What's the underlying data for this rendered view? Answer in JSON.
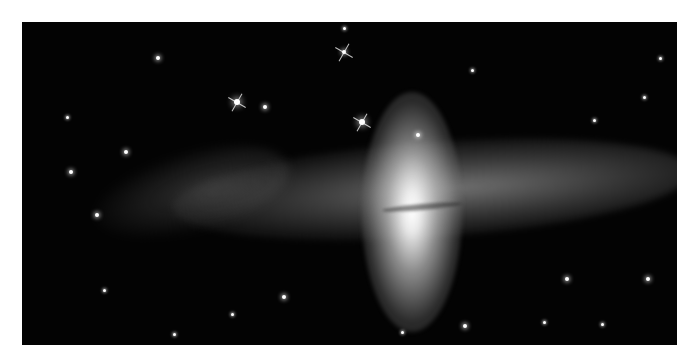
{
  "image": {
    "subject": "polar-ring galaxy",
    "description": "Astronomical photograph of a galaxy with a bright vertical elliptical bulge crossed by a horizontal ring of stars and dust, on a black starfield background with a white border",
    "colors": {
      "background": "#ffffff",
      "sky": "#030303",
      "core": "#ffffff"
    }
  },
  "stars": [
    {
      "x": 215,
      "y": 80,
      "r": 3,
      "spikes": true
    },
    {
      "x": 340,
      "y": 100,
      "r": 3,
      "spikes": true
    },
    {
      "x": 322,
      "y": 30,
      "r": 2,
      "spikes": true
    },
    {
      "x": 136,
      "y": 36,
      "r": 2
    },
    {
      "x": 243,
      "y": 85,
      "r": 2
    },
    {
      "x": 104,
      "y": 130,
      "r": 2
    },
    {
      "x": 49,
      "y": 150,
      "r": 2
    },
    {
      "x": 75,
      "y": 193,
      "r": 2
    },
    {
      "x": 396,
      "y": 113,
      "r": 2
    },
    {
      "x": 545,
      "y": 257,
      "r": 2
    },
    {
      "x": 626,
      "y": 257,
      "r": 2
    },
    {
      "x": 262,
      "y": 275,
      "r": 2
    },
    {
      "x": 443,
      "y": 304,
      "r": 2
    },
    {
      "x": 638,
      "y": 36,
      "r": 1.5
    },
    {
      "x": 322,
      "y": 6,
      "r": 1.5
    },
    {
      "x": 45,
      "y": 95,
      "r": 1.5
    },
    {
      "x": 622,
      "y": 75,
      "r": 1.5
    },
    {
      "x": 572,
      "y": 98,
      "r": 1.5
    },
    {
      "x": 522,
      "y": 300,
      "r": 1.5
    },
    {
      "x": 580,
      "y": 302,
      "r": 1.5
    },
    {
      "x": 210,
      "y": 292,
      "r": 1.5
    },
    {
      "x": 82,
      "y": 268,
      "r": 1.5
    },
    {
      "x": 152,
      "y": 312,
      "r": 1.5
    },
    {
      "x": 380,
      "y": 310,
      "r": 1.5
    },
    {
      "x": 450,
      "y": 48,
      "r": 1.5
    }
  ]
}
